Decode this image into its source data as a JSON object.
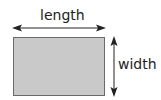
{
  "diagram": {
    "labels": {
      "length": "length",
      "width": "width"
    },
    "colors": {
      "rectangle_fill": "#c9c9c9",
      "rectangle_border": "#6a6a6a",
      "arrow": "#222222",
      "text": "#222222"
    },
    "shapes": [
      {
        "type": "rectangle",
        "name": "shaded-rectangle"
      },
      {
        "type": "double-arrow",
        "orientation": "horizontal",
        "label": "length"
      },
      {
        "type": "double-arrow",
        "orientation": "vertical",
        "label": "width"
      }
    ]
  }
}
